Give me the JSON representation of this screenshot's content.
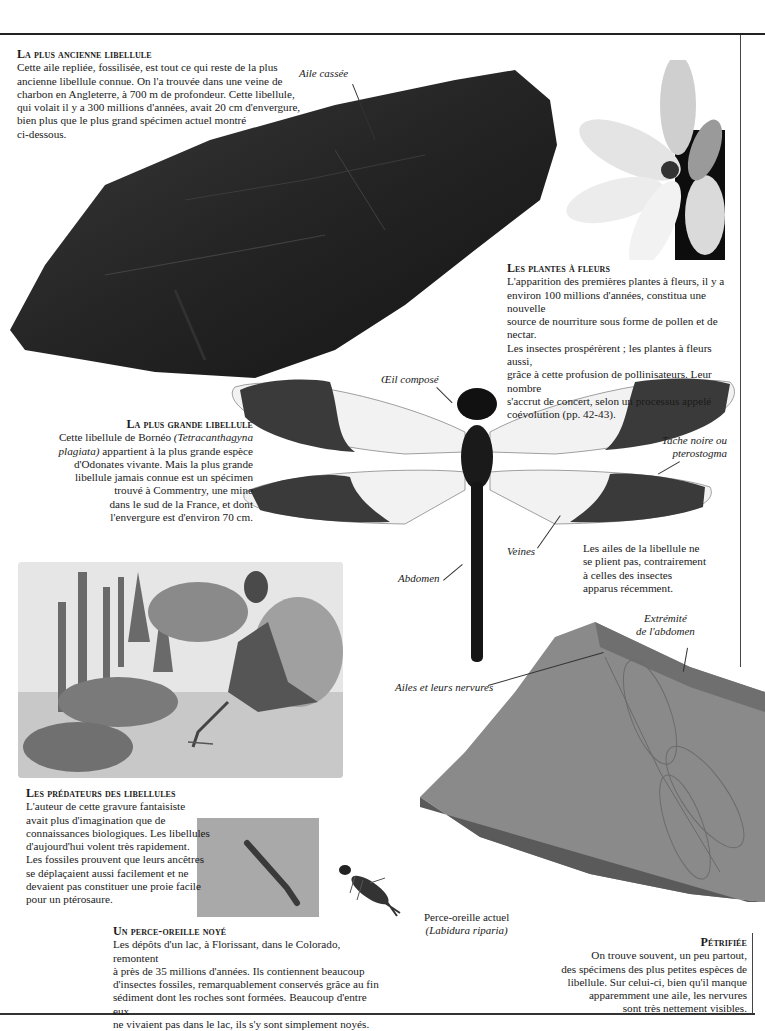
{
  "page": {
    "background": "#ffffff",
    "rule_color": "#222222"
  },
  "sections": {
    "oldest": {
      "heading": "La plus ancienne libellule",
      "text": "Cette aile repliée, fossilisée, est tout ce qui reste de la plus ancienne libellule connue. On l'a trouvée dans une veine de charbon en Angleterre, à 700 m de profondeur. Cette libellule, qui volait il y a 300 millions d'années, avait 20 cm d'envergure, bien plus que le plus grand spécimen actuel montré ci-dessous.",
      "lines": [
        "Cette aile repliée, fossilisée, est tout ce qui reste de la plus",
        "ancienne libellule connue. On l'a trouvée dans une veine de",
        "charbon en Angleterre, à 700 m de profondeur. Cette libellule,",
        "qui volait il y a 300 millions d'années, avait 20 cm d'envergure,",
        "bien plus que le plus grand spécimen actuel montré",
        "ci-dessous."
      ]
    },
    "flowers": {
      "heading": "Les plantes à fleurs",
      "lines": [
        "L'apparition des premières plantes à fleurs, il y a",
        "environ 100 millions d'années, constitua une nouvelle",
        "source de nourriture sous forme de pollen et de nectar.",
        "Les insectes prospérèrent ; les plantes à fleurs aussi,",
        "grâce à cette profusion de pollinisateurs. Leur nombre",
        "s'accrut de concert, selon un processus appelé",
        "coévolution (pp. 42-43)."
      ]
    },
    "largest": {
      "heading": "La plus grande libellule",
      "line1_pre": "Cette libellule de Bornéo ",
      "line1_italic": "(Tetracanthagyna",
      "line2_italic": "plagiata)",
      "line2_post": " appartient à la plus grande espèce",
      "lines_rest": [
        "d'Odonates vivante. Mais la plus grande",
        "libellule jamais connue est un spécimen",
        "trouvé à Commentry, une mine",
        "dans le sud de la France, et dont",
        "l'envergure est d'environ 70 cm."
      ]
    },
    "wings_note": {
      "lines": [
        "Les ailes de la libellule ne",
        "se plient pas, contrairement",
        "à celles des insectes",
        "apparus récemment."
      ]
    },
    "predators": {
      "heading": "Les prédateurs des libellules",
      "lines": [
        "L'auteur de cette gravure fantaisiste",
        "avait plus d'imagination que de",
        "connaissances biologiques. Les libellules",
        "d'aujourd'hui volent très rapidement.",
        "Les fossiles prouvent que leurs ancêtres",
        "se déplaçaient aussi facilement et ne",
        "devaient pas constituer une proie facile",
        "pour un ptérosaure."
      ]
    },
    "earwig": {
      "heading": "Un perce-oreille noyé",
      "lines": [
        "Les dépôts d'un lac, à Florissant, dans le Colorado, remontent",
        "à près de 35 millions d'années. Ils contiennent beaucoup",
        "d'insectes fossiles, remarquablement conservés grâce au fin",
        "sédiment dont les roches sont formées. Beaucoup d'entre eux",
        "ne vivaient pas dans le lac, ils s'y sont simplement noyés."
      ]
    },
    "earwig_caption": {
      "line1": "Perce-oreille actuel",
      "line2": "(Labidura riparia)"
    },
    "petrified": {
      "heading": "Pétrifiée",
      "lines": [
        "On trouve souvent, un peu partout,",
        "des spécimens des plus petites espèces de",
        "libellule. Sur celui-ci, bien qu'il manque",
        "apparemment une aile, les nervures",
        "sont très nettement visibles."
      ]
    }
  },
  "labels": {
    "broken_wing": "Aile cassée",
    "compound_eye": "Œil composé",
    "pterostigma_1": "Tache noire ou",
    "pterostigma_2": "pterostogma",
    "veins": "Veines",
    "abdomen": "Abdomen",
    "abdomen_tip_1": "Extrémité",
    "abdomen_tip_2": "de l'abdomen",
    "wings_veins": "Ailes et leurs nervures"
  },
  "images": {
    "coal_fossil": "coal-fossil-photo",
    "magnolia": "magnolia-flower-photo",
    "dragonfly": "dragonfly-specimen-photo",
    "engraving": "pterosaur-engraving",
    "slab": "petrified-dragonfly-slab",
    "earwig_fossil": "fossil-earwig-photo",
    "earwig_live": "earwig-photo"
  }
}
